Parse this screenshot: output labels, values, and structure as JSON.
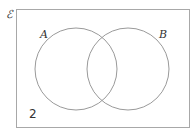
{
  "diagram": {
    "type": "venn",
    "universal_label": "ℰ",
    "sets": [
      {
        "label": "A"
      },
      {
        "label": "B"
      }
    ],
    "outside_value": "2",
    "colors": {
      "stroke": "#9a9a9a",
      "text": "#333333"
    }
  }
}
